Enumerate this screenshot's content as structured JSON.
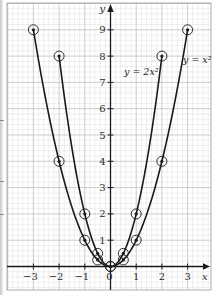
{
  "chart_data": {
    "type": "line",
    "title": "",
    "xlabel": "x",
    "ylabel": "y",
    "xlim": [
      -3.9,
      3.9
    ],
    "ylim": [
      -0.9,
      10.0
    ],
    "grid": true,
    "grid_minor_divisions": 5,
    "x_ticks": [
      -3,
      -2,
      -1,
      0,
      1,
      2,
      3
    ],
    "x_tick_labels": [
      "−3",
      "−2",
      "−1",
      "0",
      "1",
      "2",
      "3"
    ],
    "y_ticks": [
      1,
      2,
      3,
      4,
      5,
      6,
      7,
      8,
      9
    ],
    "y_tick_labels": [
      "1",
      "2",
      "3",
      "4",
      "5",
      "6",
      "7",
      "8",
      "9"
    ],
    "series": [
      {
        "name": "y = x²",
        "label": "y = x²",
        "color": "#1a1a1a",
        "marker": "circled-dot",
        "x": [
          -3,
          -2,
          -1,
          -0.5,
          0,
          0.5,
          1,
          2,
          3
        ],
        "values": [
          9,
          4,
          1,
          0.25,
          0,
          0.25,
          1,
          4,
          9
        ]
      },
      {
        "name": "y = 2x²",
        "label": "y = 2x²",
        "color": "#1a1a1a",
        "marker": "circled-dot",
        "x": [
          -2,
          -1,
          -0.5,
          0,
          0.5,
          1,
          2
        ],
        "values": [
          8,
          2,
          0.5,
          0,
          0.5,
          2,
          8
        ]
      }
    ],
    "legend": "inline labels near curve ends"
  },
  "labels": {
    "x_axis": "x",
    "y_axis": "y",
    "curve_1": "y = x²",
    "curve_2": "y = 2x²"
  },
  "colors": {
    "grid_major": "#b8b8b8",
    "grid_minor": "#dedede",
    "axis": "#1a1a1a",
    "curve": "#1a1a1a",
    "background": "#ffffff"
  }
}
